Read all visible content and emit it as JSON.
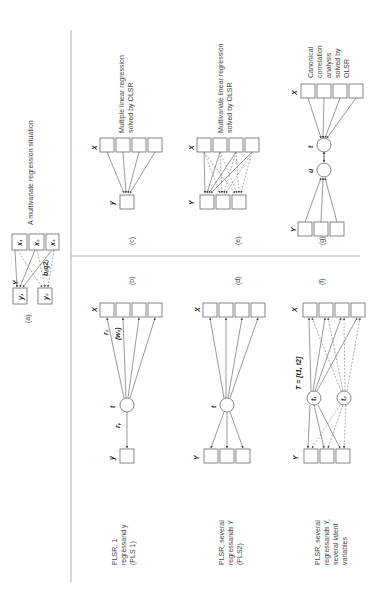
{
  "figure": {
    "orientation": "rotated-90-ccw",
    "panels": {
      "a": {
        "label": "(a)",
        "title": "A multivariate regression situation",
        "x_group": "x",
        "y_group": "Y",
        "x_nodes": [
          "x1",
          "x2",
          "x3"
        ],
        "y_nodes": [
          "y1",
          "y2"
        ],
        "coef_label": "bq2"
      },
      "b": {
        "label": "(b)",
        "description": "PLSR, 1 regressand y (PLS 1)",
        "desc_lines": [
          "PLSR, 1",
          "regressand y",
          "(PLS 1)"
        ],
        "latent": "t",
        "x_group": "X",
        "y_group": "y",
        "edge_labels": [
          "r1",
          "(w1)",
          "ry"
        ]
      },
      "c": {
        "label": "(c)",
        "description": "Multiple linear regression solved by OLSR",
        "desc_lines": [
          "Multiple linear regression",
          "solved by OLSR"
        ],
        "x_group": "X",
        "y_group": "y"
      },
      "d": {
        "label": "(d)",
        "description": "PLSR, several regressands Y (PLS2)",
        "desc_lines": [
          "PLSR, several",
          "regressands Y",
          "(PLS2)"
        ],
        "latent": "t",
        "x_group": "X",
        "y_group": "Y"
      },
      "e": {
        "label": "(e)",
        "description": "Multivariate linear regression solved by OLSR",
        "desc_lines": [
          "Multivariate linear regression",
          "solved by OLSR"
        ],
        "x_group": "X",
        "y_group": "Y"
      },
      "f": {
        "label": "(f)",
        "description": "PLSR, several regressands Y, several latent variables",
        "desc_lines": [
          "PLSR, several",
          "regressands Y,",
          "several latent",
          "variables"
        ],
        "latent_matrix": "T = [t1, t2]",
        "latents": [
          "t1",
          "t2"
        ],
        "x_group": "X",
        "y_group": "Y"
      },
      "g": {
        "label": "(g)",
        "description": "Canonical correlation analysis solved by OLSR",
        "desc_lines": [
          "Canonical",
          "correlation",
          "analysis",
          "solved by",
          "OLSR"
        ],
        "latents": [
          "t",
          "u"
        ],
        "x_group": "X",
        "y_group": "Y"
      }
    }
  }
}
